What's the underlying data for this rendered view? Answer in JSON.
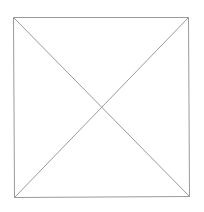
{
  "diagram": {
    "type": "crossed-square",
    "stroke_color": "#9a9a9a",
    "background": "#ffffff",
    "square": {
      "top_left": [
        13,
        17
      ],
      "top_right": [
        188,
        17
      ],
      "bottom_right": [
        189,
        196
      ],
      "bottom_left": [
        14,
        197
      ]
    },
    "diagonals": [
      {
        "from": [
          13,
          17
        ],
        "to": [
          189,
          196
        ]
      },
      {
        "from": [
          188,
          17
        ],
        "to": [
          14,
          197
        ]
      }
    ],
    "intersection": [
      101,
      107
    ]
  }
}
